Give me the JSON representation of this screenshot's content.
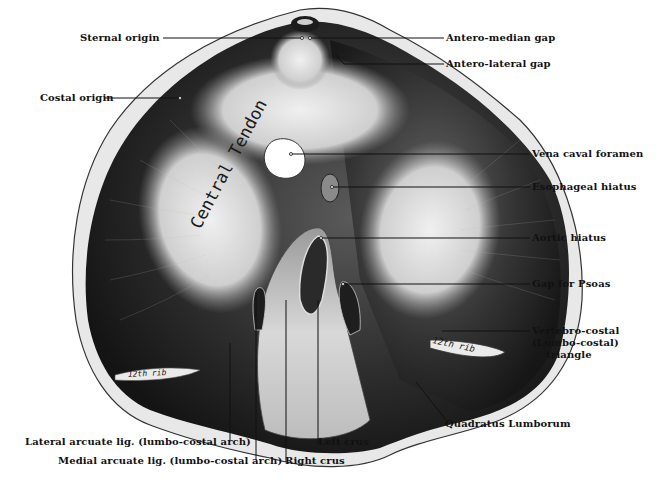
{
  "figure": {
    "inner_labels": {
      "central_tendon": "Central Tendon",
      "rib_right": "12th rib",
      "rib_left": "12th rib"
    },
    "colors": {
      "background": "#ffffff",
      "ink": "#111111",
      "muscle_dark": "#2b2b2b",
      "tendon_light": "#d9d9d9",
      "rim": "#e6e6e6"
    }
  },
  "labels": {
    "sternal_origin": "Sternal origin",
    "antero_median_gap": "Antero-median gap",
    "antero_lateral_gap": "Antero-lateral gap",
    "costal_origin": "Costal origin",
    "vena_caval_foramen": "Vena caval foramen",
    "esophageal_hiatus": "Esophageal hiatus",
    "aortic_hiatus": "Aortic hiatus",
    "gap_for_psoas": "Gap for Psoas",
    "vertebro_costal_triangle": "Vertebro-costal\n(Lumbo-costal)\n    triangle",
    "quadratus_lumborum": "Quadratus Lumborum",
    "lateral_arcuate_lig": "Lateral arcuate lig. (lumbo-costal arch)",
    "medial_arcuate_lig": "Medial arcuate lig. (lumbo-costal arch)",
    "right_crus": "Right crus",
    "left_crus": "Left crus"
  }
}
